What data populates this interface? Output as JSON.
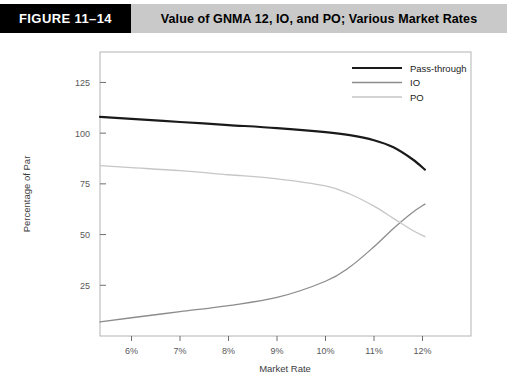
{
  "figure": {
    "number_label": "FIGURE 11–14",
    "title": "Value of GNMA 12, IO, and PO; Various Market Rates"
  },
  "colors": {
    "header_bar": "#c9c9c9",
    "header_box": "#000000",
    "header_box_text": "#ffffff",
    "pass_through": "#1a1a1a",
    "io": "#8c8c8c",
    "po": "#c6c6c6",
    "axis": "#6e6e70",
    "plot_frame": "#b4b4b6",
    "background": "#ffffff"
  },
  "chart_data": {
    "type": "line",
    "title": "Value of GNMA 12, IO, and PO; Various Market Rates",
    "xlabel": "Market Rate",
    "ylabel": "Percentage of Par",
    "xlim": [
      5.35,
      13.0
    ],
    "ylim": [
      0,
      140
    ],
    "xticks": [
      6,
      7,
      8,
      9,
      10,
      11,
      12
    ],
    "xtick_labels": [
      "6%",
      "7%",
      "8%",
      "9%",
      "10%",
      "11%",
      "12%"
    ],
    "yticks": [
      25,
      50,
      75,
      100,
      125
    ],
    "ytick_labels": [
      "25",
      "50",
      "75",
      "100",
      "125"
    ],
    "grid": false,
    "legend_position": "top-right",
    "series": [
      {
        "name": "Pass-through",
        "color": "#1a1a1a",
        "width": 2.2,
        "x": [
          5.35,
          6.0,
          7.0,
          8.0,
          9.0,
          10.0,
          10.5,
          11.0,
          11.4,
          11.8,
          12.05
        ],
        "values": [
          108,
          107,
          105.5,
          104,
          102.5,
          100.5,
          99,
          96.5,
          93,
          87,
          82
        ]
      },
      {
        "name": "IO",
        "color": "#8c8c8c",
        "width": 1.3,
        "x": [
          5.35,
          6.0,
          7.0,
          8.0,
          9.0,
          10.0,
          10.5,
          11.0,
          11.4,
          11.8,
          12.05
        ],
        "values": [
          7,
          9,
          12,
          15,
          19,
          27,
          34,
          44,
          53,
          61,
          65
        ]
      },
      {
        "name": "PO",
        "color": "#c6c6c6",
        "width": 1.3,
        "x": [
          5.35,
          6.0,
          7.0,
          8.0,
          9.0,
          10.0,
          10.5,
          11.0,
          11.4,
          11.8,
          12.05
        ],
        "values": [
          84,
          83,
          81.5,
          79.5,
          77.5,
          74,
          70,
          64,
          58,
          52,
          49
        ]
      }
    ],
    "annotations": [
      {
        "text": "IO and PO cross near 11.2%",
        "value": 53
      }
    ]
  },
  "legend": {
    "items": [
      {
        "label": "Pass-through"
      },
      {
        "label": "IO"
      },
      {
        "label": "PO"
      }
    ]
  }
}
